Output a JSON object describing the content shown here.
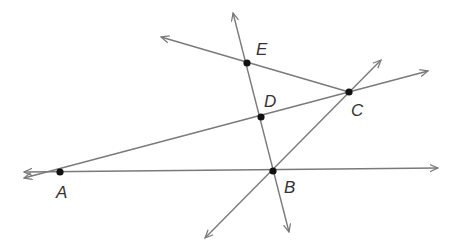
{
  "diagram": {
    "type": "geometry-lines-and-points",
    "colors": {
      "line": "#7a7a7a",
      "point": "#111111",
      "label": "#333333",
      "background": "#ffffff"
    },
    "points": [
      {
        "id": "A",
        "label": "A",
        "x": 60,
        "y": 172,
        "lx": 56,
        "ly": 198
      },
      {
        "id": "B",
        "label": "B",
        "x": 273,
        "y": 171,
        "lx": 284,
        "ly": 193
      },
      {
        "id": "C",
        "label": "C",
        "x": 349,
        "y": 92,
        "lx": 351,
        "ly": 116
      },
      {
        "id": "D",
        "label": "D",
        "x": 261,
        "y": 117,
        "lx": 264,
        "ly": 107
      },
      {
        "id": "E",
        "label": "E",
        "x": 247,
        "y": 63,
        "lx": 256,
        "ly": 55
      }
    ],
    "lines": [
      {
        "id": "line-AB",
        "through": [
          "A",
          "B"
        ],
        "x1": 24,
        "y1": 172,
        "x2": 438,
        "y2": 168,
        "arrow_start": true,
        "arrow_end": true
      },
      {
        "id": "line-ADC",
        "through": [
          "A",
          "D",
          "C"
        ],
        "x1": 24,
        "y1": 178,
        "x2": 428,
        "y2": 71,
        "arrow_start": true,
        "arrow_end": true
      },
      {
        "id": "line-EC",
        "through": [
          "E",
          "C"
        ],
        "x1": 161,
        "y1": 37,
        "x2": 349,
        "y2": 92,
        "arrow_start": true,
        "arrow_end": false
      },
      {
        "id": "line-EDB",
        "through": [
          "E",
          "D",
          "B"
        ],
        "x1": 233,
        "y1": 13,
        "x2": 289,
        "y2": 232,
        "arrow_start": true,
        "arrow_end": true
      },
      {
        "id": "line-BC",
        "through": [
          "B",
          "C"
        ],
        "x1": 205,
        "y1": 238,
        "x2": 381,
        "y2": 60,
        "arrow_start": true,
        "arrow_end": true
      }
    ]
  }
}
